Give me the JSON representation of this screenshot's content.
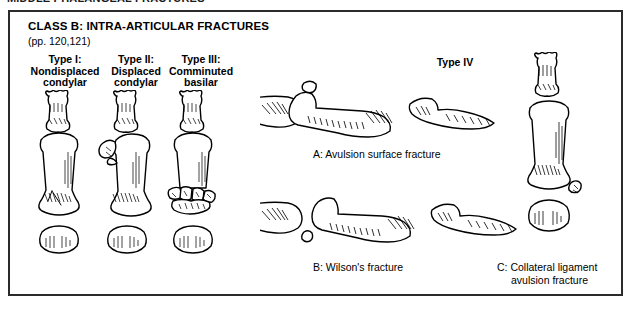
{
  "page": {
    "running_header": "MIDDLE PHALANGEAL FRACTURES"
  },
  "figure": {
    "class_title": "CLASS B: INTRA-ARTICULAR FRACTURES",
    "page_reference": "(pp. 120,121)",
    "background_color": "#ffffff",
    "ink_color": "#000000",
    "frame_color": "#2b2b2b",
    "ap_types": [
      {
        "id": "type-1",
        "line1": "Type I:",
        "line2": "Nondisplaced",
        "line3": "condylar"
      },
      {
        "id": "type-2",
        "line1": "Type II:",
        "line2": "Displaced",
        "line3": "condylar"
      },
      {
        "id": "type-3",
        "line1": "Type III:",
        "line2": "Comminuted",
        "line3": "basilar"
      }
    ],
    "type_four": {
      "heading": "Type IV",
      "items": [
        {
          "id": "item-a",
          "label": "A: Avulsion surface fracture"
        },
        {
          "id": "item-b",
          "label": "B: Wilson's fracture"
        },
        {
          "id": "item-c",
          "label_line1": "C: Collateral ligament",
          "label_line2": "avulsion fracture"
        }
      ]
    }
  }
}
